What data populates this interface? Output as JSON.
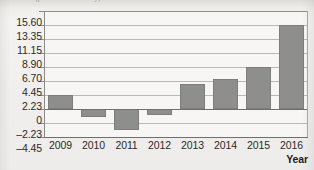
{
  "figure": {
    "clipped_top_text": "Unit (percent annually)",
    "background_color": "#f2f1ef",
    "plot_background_color": "#f7f6f4",
    "bar_color": "#8e8e8c",
    "bar_border_color": "#7d7d7b",
    "gridline_color": "#b9b8b5",
    "axis_color": "#6f6f6d",
    "axis_title_x": "Year"
  },
  "chart_data": {
    "type": "bar",
    "title": "",
    "xlabel": "Year",
    "ylabel": "",
    "categories": [
      "2009",
      "2010",
      "2011",
      "2012",
      "2013",
      "2014",
      "2015",
      "2016"
    ],
    "values": [
      2.23,
      -1.3,
      -3.4,
      -0.9,
      3.9,
      4.8,
      6.75,
      13.35
    ],
    "ylim": [
      -4.45,
      15.6
    ],
    "yticks": [
      15.6,
      13.35,
      11.15,
      8.9,
      6.7,
      4.45,
      2.23,
      0,
      -2.23,
      -4.45
    ],
    "ytick_labels": [
      "15.60",
      "13.35",
      "11.15",
      "8.90",
      "6.70",
      "4.45",
      "2.23",
      "0",
      "–2.23",
      "–4.45"
    ],
    "grid": true,
    "legend": null,
    "series": [
      {
        "name": "value",
        "values": [
          2.23,
          -1.3,
          -3.4,
          -0.9,
          3.9,
          4.8,
          6.75,
          13.35
        ]
      }
    ]
  }
}
